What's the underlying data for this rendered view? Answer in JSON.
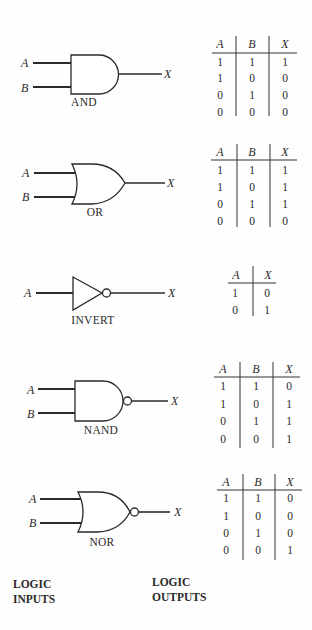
{
  "gates": [
    {
      "name": "AND",
      "inputs": [
        "A",
        "B"
      ],
      "output": "X",
      "truth_table": {
        "headers": [
          "A",
          "B",
          "X"
        ],
        "rows": [
          [
            "1",
            "1",
            "1"
          ],
          [
            "1",
            "0",
            "0"
          ],
          [
            "0",
            "1",
            "0"
          ],
          [
            "0",
            "0",
            "0"
          ]
        ]
      }
    },
    {
      "name": "OR",
      "inputs": [
        "A",
        "B"
      ],
      "output": "X",
      "truth_table": {
        "headers": [
          "A",
          "B",
          "X"
        ],
        "rows": [
          [
            "1",
            "1",
            "1"
          ],
          [
            "1",
            "0",
            "1"
          ],
          [
            "0",
            "1",
            "1"
          ],
          [
            "0",
            "0",
            "0"
          ]
        ]
      }
    },
    {
      "name": "INVERT",
      "inputs": [
        "A"
      ],
      "output": "X",
      "truth_table": {
        "headers": [
          "A",
          "X"
        ],
        "rows": [
          [
            "1",
            "0"
          ],
          [
            "0",
            "1"
          ]
        ]
      }
    },
    {
      "name": "NAND",
      "inputs": [
        "A",
        "B"
      ],
      "output": "X",
      "truth_table": {
        "headers": [
          "A",
          "B",
          "X"
        ],
        "rows": [
          [
            "1",
            "1",
            "0"
          ],
          [
            "1",
            "0",
            "1"
          ],
          [
            "0",
            "1",
            "1"
          ],
          [
            "0",
            "0",
            "1"
          ]
        ]
      }
    },
    {
      "name": "NOR",
      "inputs": [
        "A",
        "B"
      ],
      "output": "X",
      "truth_table": {
        "headers": [
          "A",
          "B",
          "X"
        ],
        "rows": [
          [
            "1",
            "1",
            "0"
          ],
          [
            "1",
            "0",
            "0"
          ],
          [
            "0",
            "1",
            "0"
          ],
          [
            "0",
            "0",
            "1"
          ]
        ]
      }
    }
  ],
  "footer": {
    "inputs_label_line1": "LOGIC",
    "inputs_label_line2": "INPUTS",
    "outputs_label_line1": "LOGIC",
    "outputs_label_line2": "OUTPUTS"
  },
  "colors": {
    "ink": "#2a2a2a",
    "paper": "#fefefe"
  }
}
